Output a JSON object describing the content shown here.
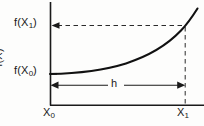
{
  "figure": {
    "background_color": "#fdfdfc",
    "ink_color": "#1a1a1a"
  },
  "labels": {
    "y_axis": {
      "base": "f(X)",
      "text": "f(X)"
    },
    "f_x1": {
      "prefix": "f(X",
      "subscript": "1",
      "suffix": ")",
      "text": "f(X1)"
    },
    "f_x0": {
      "prefix": "f(X",
      "subscript": "0",
      "suffix": ")",
      "text": "f(X0)"
    },
    "x0": {
      "prefix": "X",
      "subscript": "0",
      "text": "X0"
    },
    "x1": {
      "prefix": "X",
      "subscript": "1",
      "text": "X1"
    },
    "h": {
      "text": "h"
    }
  },
  "chart_data": {
    "type": "line",
    "title": "",
    "xlabel": "",
    "ylabel": "f(X)",
    "grid": false,
    "legend_position": "none",
    "annotations": [
      {
        "name": "f_x1",
        "text": "f(X1)",
        "x": 14,
        "y": 17,
        "role": "y-value-label"
      },
      {
        "name": "f_x0",
        "text": "f(X0)",
        "x": 14,
        "y": 65,
        "role": "y-value-label"
      },
      {
        "name": "x0",
        "text": "X0",
        "x": 43,
        "y": 107,
        "role": "x-value-label"
      },
      {
        "name": "x1",
        "text": "X1",
        "x": 177,
        "y": 107,
        "role": "x-value-label"
      },
      {
        "name": "h",
        "text": "h",
        "x": 111,
        "y": 78,
        "role": "interval-label"
      }
    ],
    "axis_pixels": {
      "y_axis_x": 50,
      "y_axis_top": 2,
      "y_axis_bottom": 105,
      "x_axis_y": 105,
      "x_axis_left": 50,
      "x_axis_right": 204
    },
    "series": [
      {
        "name": "f(X)",
        "kind": "curve",
        "points": [
          [
            50,
            74
          ],
          [
            70,
            72.6
          ],
          [
            90,
            70.4
          ],
          [
            110,
            66.6
          ],
          [
            130,
            61.2
          ],
          [
            150,
            53.6
          ],
          [
            165,
            45.6
          ],
          [
            175,
            38.4
          ],
          [
            185,
            26.0
          ],
          [
            192,
            16.0
          ],
          [
            197,
            9.0
          ]
        ]
      }
    ],
    "guides": [
      {
        "name": "f-x1-dashed-leader",
        "kind": "dashed-horizontal-arrow",
        "from": [
          185,
          25.5
        ],
        "to": [
          50,
          25.5
        ],
        "arrow_at": "end"
      },
      {
        "name": "x1-dashed-drop",
        "kind": "dashed-vertical",
        "from": [
          185,
          25.5
        ],
        "to": [
          185,
          105
        ]
      },
      {
        "name": "f-x0-level",
        "kind": "solid-horizontal",
        "from": [
          50,
          74
        ],
        "to": [
          56,
          74
        ]
      },
      {
        "name": "h-measure",
        "kind": "double-arrow-horizontal",
        "from": [
          50,
          85
        ],
        "to": [
          185,
          85
        ],
        "gap_label": "h"
      }
    ]
  }
}
